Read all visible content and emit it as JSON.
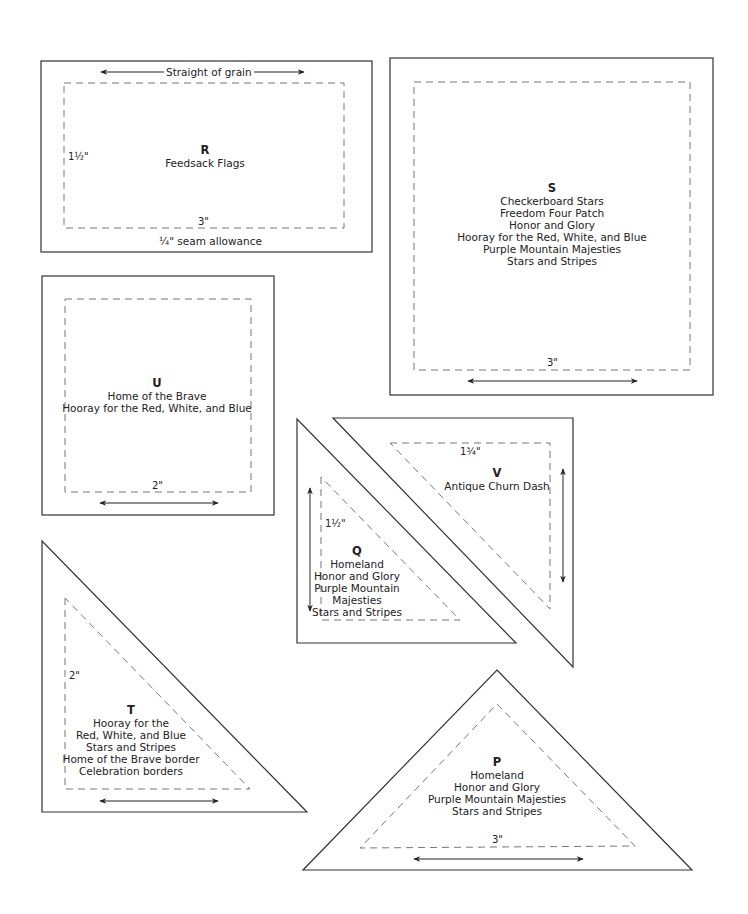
{
  "colors": {
    "outline": "#333333",
    "dashed": "#666666",
    "text": "#222222",
    "background": "#ffffff"
  },
  "pieces": {
    "R": {
      "letter": "R",
      "patterns": [
        "Feedsack Flags"
      ],
      "grain_label": "Straight of grain",
      "height_dim": "1½\"",
      "width_dim": "3\"",
      "seam_label": "¼\" seam allowance"
    },
    "S": {
      "letter": "S",
      "patterns": [
        "Checkerboard Stars",
        "Freedom Four Patch",
        "Honor and Glory",
        "Hooray for the Red, White, and Blue",
        "Purple Mountain Majesties",
        "Stars and Stripes"
      ],
      "width_dim": "3\""
    },
    "U": {
      "letter": "U",
      "patterns": [
        "Home of the Brave",
        "Hooray for the Red, White, and Blue"
      ],
      "width_dim": "2\""
    },
    "Q": {
      "letter": "Q",
      "patterns": [
        "Homeland",
        "Honor and Glory",
        "Purple Mountain",
        "Majesties",
        "Stars and Stripes"
      ],
      "height_dim": "1½\""
    },
    "V": {
      "letter": "V",
      "patterns": [
        "Antique Churn Dash"
      ],
      "width_dim": "1¾\""
    },
    "T": {
      "letter": "T",
      "patterns": [
        "Hooray for the",
        "Red, White, and Blue",
        "Stars and Stripes",
        "Home of the Brave border",
        "Celebration borders"
      ],
      "height_dim": "2\""
    },
    "P": {
      "letter": "P",
      "patterns": [
        "Homeland",
        "Honor and Glory",
        "Purple Mountain Majesties",
        "Stars and Stripes"
      ],
      "width_dim": "3\""
    }
  }
}
